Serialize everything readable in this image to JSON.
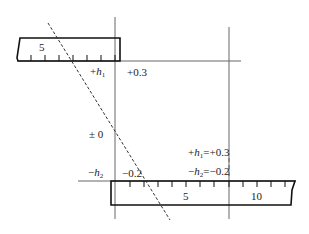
{
  "diagram": {
    "top_ruler": {
      "tick_label": "5"
    },
    "bottom_ruler": {
      "tick_labels": [
        "5",
        "10"
      ]
    },
    "labels": {
      "plus_h1_sign": "+",
      "h_var": "h",
      "sub1": "1",
      "sub2": "2",
      "plus_0_3": "+0.3",
      "plus_minus_0": "± 0",
      "minus_h2_sign": "−",
      "minus_0_2": "−0.2",
      "eq_plus": "=+0.3",
      "eq_minus": "=−0.2"
    },
    "colors": {
      "line": "#222222",
      "axis": "#555555",
      "dashed": "#333333"
    }
  }
}
